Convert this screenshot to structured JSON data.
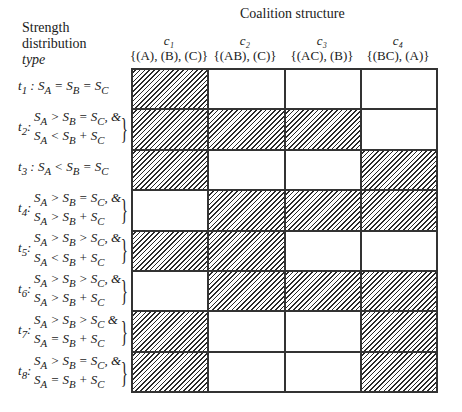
{
  "title": "Coalition structure",
  "row_header": [
    "Strength",
    "distribution",
    "type"
  ],
  "columns": [
    {
      "id": "c1",
      "label": "c₁",
      "structure": "{(A), (B), (C)}"
    },
    {
      "id": "c2",
      "label": "c₂",
      "structure": "{(AB), (C)}"
    },
    {
      "id": "c3",
      "label": "c₃",
      "structure": "{(AC), (B)}"
    },
    {
      "id": "c4",
      "label": "c₄",
      "structure": "{(BC), (A)}"
    }
  ],
  "rows": [
    {
      "id": "t1",
      "label": "t₁",
      "lines": [
        "t₁ : S_A = S_B = S_C"
      ],
      "single": "t₁ : Sₐ = Sʙ = S꜀",
      "hatched": [
        true,
        false,
        false,
        false
      ]
    },
    {
      "id": "t2",
      "label": "t₂ :",
      "lines": [
        "S_A > S_B = S_C, &",
        "S_A < S_B + S_C"
      ],
      "hatched": [
        true,
        true,
        true,
        false
      ]
    },
    {
      "id": "t3",
      "label": "t₃",
      "single": "t₃ : S_A < S_B = S_C",
      "hatched": [
        true,
        false,
        false,
        true
      ]
    },
    {
      "id": "t4",
      "label": "t₄ :",
      "lines": [
        "S_A > S_B = S_C, &",
        "S_A > S_B + S_C"
      ],
      "hatched": [
        false,
        true,
        true,
        true
      ]
    },
    {
      "id": "t5",
      "label": "t₅ :",
      "lines": [
        "S_A > S_B > S_C, &",
        "S_A < S_B + S_C"
      ],
      "hatched": [
        true,
        true,
        false,
        false
      ]
    },
    {
      "id": "t6",
      "label": "t₆ :",
      "lines": [
        "S_A > S_B > S_C, &",
        "S_A > S_B + S_C"
      ],
      "hatched": [
        false,
        true,
        true,
        true
      ]
    },
    {
      "id": "t7",
      "label": "t₇ :",
      "lines": [
        "S_A > S_B > S_C &",
        "S_A = S_B + S_C"
      ],
      "hatched": [
        true,
        false,
        false,
        true
      ]
    },
    {
      "id": "t8",
      "label": "t₈ :",
      "lines": [
        "S_A > S_B = S_C, &",
        "S_A = S_B + S_C"
      ],
      "hatched": [
        true,
        false,
        false,
        true
      ]
    }
  ]
}
